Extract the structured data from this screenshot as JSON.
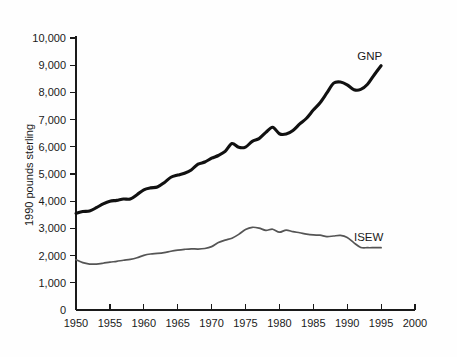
{
  "chart_data": {
    "type": "line",
    "title": "",
    "subtitle": "",
    "xlabel": "",
    "ylabel": "1990 pounds sterling",
    "xlim": [
      1950,
      2000
    ],
    "ylim": [
      0,
      10000
    ],
    "grid": false,
    "legend_position": "inline-end-of-line",
    "x_tick_labels": [
      "1950",
      "1955",
      "1960",
      "1965",
      "1970",
      "1975",
      "1980",
      "1985",
      "1990",
      "1995",
      "2000"
    ],
    "x_ticks": [
      1950,
      1955,
      1960,
      1965,
      1970,
      1975,
      1980,
      1985,
      1990,
      1995,
      2000
    ],
    "y_tick_labels": [
      "0",
      "1,000",
      "2,000",
      "3,000",
      "4,000",
      "5,000",
      "6,000",
      "7,000",
      "8,000",
      "9,000",
      "10,000"
    ],
    "y_ticks": [
      0,
      1000,
      2000,
      3000,
      4000,
      5000,
      6000,
      7000,
      8000,
      9000,
      10000
    ],
    "x": [
      1950,
      1951,
      1952,
      1953,
      1954,
      1955,
      1956,
      1957,
      1958,
      1959,
      1960,
      1961,
      1962,
      1963,
      1964,
      1965,
      1966,
      1967,
      1968,
      1969,
      1970,
      1971,
      1972,
      1973,
      1974,
      1975,
      1976,
      1977,
      1978,
      1979,
      1980,
      1981,
      1982,
      1983,
      1984,
      1985,
      1986,
      1987,
      1988,
      1989,
      1990,
      1991,
      1992,
      1993,
      1994,
      1995
    ],
    "series": [
      {
        "name": "GNP",
        "color": "#111111",
        "line_width": 3.1,
        "label_x": 1991.5,
        "label_y": 9350,
        "values": [
          3550,
          3620,
          3640,
          3760,
          3900,
          4000,
          4030,
          4080,
          4080,
          4240,
          4420,
          4490,
          4520,
          4680,
          4880,
          4960,
          5030,
          5150,
          5360,
          5440,
          5580,
          5680,
          5830,
          6120,
          5980,
          5990,
          6200,
          6300,
          6530,
          6720,
          6480,
          6470,
          6600,
          6840,
          7050,
          7350,
          7620,
          7980,
          8340,
          8380,
          8280,
          8100,
          8110,
          8300,
          8650,
          8980
        ]
      },
      {
        "name": "ISEW",
        "color": "#555555",
        "line_width": 1.7,
        "label_x": 1991.0,
        "label_y": 2680,
        "values": [
          1850,
          1740,
          1690,
          1690,
          1720,
          1760,
          1790,
          1830,
          1860,
          1920,
          2010,
          2060,
          2080,
          2110,
          2160,
          2200,
          2230,
          2250,
          2240,
          2260,
          2330,
          2480,
          2570,
          2640,
          2780,
          2960,
          3040,
          3010,
          2930,
          2970,
          2860,
          2940,
          2880,
          2840,
          2790,
          2760,
          2750,
          2700,
          2720,
          2740,
          2670,
          2470,
          2300,
          2290,
          2290,
          2290
        ]
      }
    ]
  },
  "labels": {
    "y_axis_title": "1990 pounds sterling"
  }
}
